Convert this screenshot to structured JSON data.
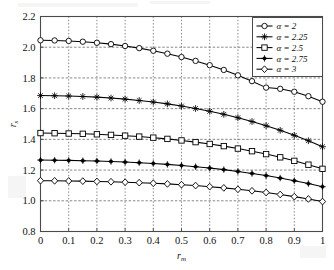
{
  "chart_data": {
    "type": "line",
    "title": "",
    "xlabel": "r_m",
    "ylabel": "r_s",
    "xlabel_base": "r",
    "xlabel_sub": "m",
    "ylabel_base": "r",
    "ylabel_sub": "s",
    "xlim": [
      0,
      1
    ],
    "ylim": [
      0.8,
      2.2
    ],
    "xticks": [
      0,
      0.1,
      0.2,
      0.3,
      0.4,
      0.5,
      0.6,
      0.7,
      0.8,
      0.9,
      1
    ],
    "xticklabels": [
      "0",
      "0.1",
      "0.2",
      "0.3",
      "0.4",
      "0.5",
      "0.6",
      "0.7",
      "0.8",
      "0.9",
      "1"
    ],
    "yticks": [
      0.8,
      1.0,
      1.2,
      1.4,
      1.6,
      1.8,
      2.0,
      2.2
    ],
    "yticklabels": [
      "0.8",
      "1.0",
      "1.2",
      "1.4",
      "1.6",
      "1.8",
      "2.0",
      "2.2"
    ],
    "grid": true,
    "grid_style": "dotted",
    "legend_position": "upper-right",
    "x": [
      0,
      0.05,
      0.1,
      0.15,
      0.2,
      0.25,
      0.3,
      0.35,
      0.4,
      0.45,
      0.5,
      0.55,
      0.6,
      0.65,
      0.7,
      0.75,
      0.8,
      0.85,
      0.9,
      0.95,
      1
    ],
    "series": [
      {
        "name": "alpha = 2",
        "legend_symbol": "α = 2",
        "alpha": 2,
        "marker": "circle-open",
        "values": [
          2.045,
          2.044,
          2.041,
          2.036,
          2.029,
          2.02,
          2.008,
          1.994,
          1.977,
          1.958,
          1.936,
          1.911,
          1.883,
          1.852,
          1.817,
          1.779,
          1.737,
          1.729,
          1.71,
          1.681,
          1.645
        ]
      },
      {
        "name": "alpha = 2.25",
        "legend_symbol": "α = 2.25",
        "alpha": 2.25,
        "marker": "asterisk",
        "values": [
          1.685,
          1.684,
          1.682,
          1.679,
          1.675,
          1.669,
          1.662,
          1.653,
          1.643,
          1.631,
          1.617,
          1.601,
          1.583,
          1.563,
          1.541,
          1.516,
          1.489,
          1.459,
          1.426,
          1.391,
          1.352
        ]
      },
      {
        "name": "alpha = 2.5",
        "legend_symbol": "α = 2.5",
        "alpha": 2.5,
        "marker": "square-open",
        "values": [
          1.441,
          1.44,
          1.438,
          1.436,
          1.433,
          1.429,
          1.424,
          1.418,
          1.411,
          1.403,
          1.393,
          1.382,
          1.37,
          1.356,
          1.34,
          1.323,
          1.304,
          1.283,
          1.26,
          1.235,
          1.208
        ]
      },
      {
        "name": "alpha = 2.75",
        "legend_symbol": "α = 2.75",
        "alpha": 2.75,
        "marker": "plus-filled",
        "values": [
          1.265,
          1.264,
          1.263,
          1.261,
          1.259,
          1.256,
          1.252,
          1.248,
          1.243,
          1.237,
          1.23,
          1.222,
          1.213,
          1.203,
          1.191,
          1.178,
          1.164,
          1.148,
          1.131,
          1.112,
          1.092
        ]
      },
      {
        "name": "alpha = 3",
        "legend_symbol": "α = 3",
        "alpha": 3,
        "marker": "diamond-open",
        "values": [
          1.131,
          1.13,
          1.129,
          1.128,
          1.126,
          1.124,
          1.121,
          1.118,
          1.114,
          1.11,
          1.105,
          1.099,
          1.092,
          1.084,
          1.075,
          1.065,
          1.054,
          1.041,
          1.027,
          1.012,
          0.995
        ]
      }
    ]
  },
  "legend": {
    "entries": [
      {
        "label": "α = 2",
        "marker": "circle-open"
      },
      {
        "label": "α = 2.25",
        "marker": "asterisk"
      },
      {
        "label": "α = 2.5",
        "marker": "square-open"
      },
      {
        "label": "α = 2.75",
        "marker": "plus-filled"
      },
      {
        "label": "α = 3",
        "marker": "diamond-open"
      }
    ]
  },
  "colors": {
    "line": "#000000",
    "axis": "#4a4a4a",
    "grid": "#666666",
    "background": "#ffffff",
    "text": "#111111"
  }
}
